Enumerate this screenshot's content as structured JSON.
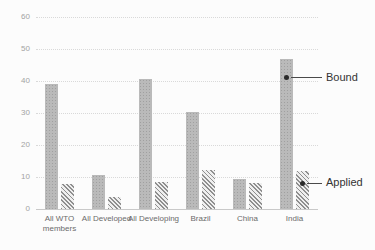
{
  "chart_data": {
    "type": "bar",
    "title": "",
    "categories": [
      "All WTO members",
      "All Developed",
      "All Developing",
      "Brazil",
      "China",
      "India"
    ],
    "series": [
      {
        "name": "Bound",
        "values": [
          39,
          10.5,
          40.5,
          30.3,
          9.3,
          47
        ]
      },
      {
        "name": "Applied",
        "values": [
          7.8,
          3.7,
          8.5,
          12.3,
          8.2,
          12
        ]
      }
    ],
    "xlabel": "",
    "ylabel": "",
    "ylim": [
      0,
      60
    ],
    "yticks": [
      0,
      10,
      20,
      30,
      40,
      50,
      60
    ],
    "grid": "horizontal-dotted",
    "legend_position": "none",
    "annotations": [
      {
        "text": "Bound",
        "category_index": 5,
        "series_index": 0,
        "value_level": 41
      },
      {
        "text": "Applied",
        "category_index": 5,
        "series_index": 1,
        "value_level": 8
      }
    ],
    "colors": {
      "bound_bar": "#b3b3b3",
      "applied_bar_hatch": "#8f8f8f",
      "gridline": "#d9d9d9",
      "axis_labels": "#a3a3a3",
      "category_labels": "#6b6b6b",
      "annotation_text": "#333333",
      "background": "#fcfcfc"
    }
  }
}
